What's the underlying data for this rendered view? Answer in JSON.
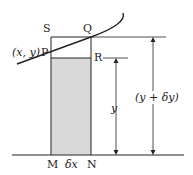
{
  "diagram": {
    "type": "area-under-curve strip",
    "colors": {
      "line": "#222222",
      "shade": "#d9d9d9",
      "background": "#ffffff"
    },
    "points": {
      "S": "S",
      "Q": "Q",
      "P": "P",
      "R": "R",
      "M": "M",
      "N": "N"
    },
    "labels": {
      "point_p_coords": "(x, y)",
      "width": "δx",
      "height_small": "y",
      "height_large": "(y + δy)"
    }
  }
}
